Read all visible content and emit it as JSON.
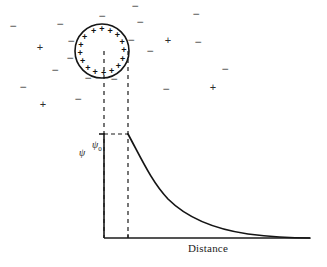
{
  "figure": {
    "kind": "electric-double-layer-diagram",
    "background_color": "#ffffff",
    "stroke_color": "#1b1b1b",
    "ion_color": "#3a3a3a"
  },
  "axes": {
    "y_axis_label": "ψ",
    "y_tick_label": "ψ",
    "y_tick_subscript": "0",
    "x_axis_label": "Distance",
    "origin": {
      "x": 104,
      "y": 238
    },
    "x_axis_end": {
      "x": 310,
      "y": 238
    },
    "y_axis_top": {
      "x": 104,
      "y": 133
    }
  },
  "particle": {
    "center": {
      "x": 102,
      "y": 51
    },
    "radius": 27,
    "surface_charge_symbol": "+",
    "surface_charge_count": 16,
    "surface_charge_angles_deg": [
      -112,
      -90,
      -68,
      -46,
      -24,
      -2,
      20,
      42,
      64,
      86,
      108,
      130,
      152,
      174,
      196,
      218
    ]
  },
  "guides": {
    "center_dashed_line_x": 104,
    "edge_dashed_line_x": 128,
    "dashed_top_y": 51,
    "dashed_bottom_y": 238,
    "potential_dashed_y": 134
  },
  "chart_data": {
    "type": "line",
    "title": "",
    "xlabel": "Distance",
    "ylabel": "ψ",
    "grid": false,
    "legend": "none",
    "annotations": [
      {
        "text": "ψ₀",
        "role": "surface-potential-tick",
        "x": 0.0,
        "y": 1.0
      }
    ],
    "xlim": [
      0,
      1
    ],
    "ylim": [
      0,
      1.05
    ],
    "series": [
      {
        "name": "potential-decay",
        "model": "exponential",
        "x": [
          0.0,
          0.05,
          0.1,
          0.15,
          0.2,
          0.25,
          0.3,
          0.35,
          0.4,
          0.45,
          0.5,
          0.55,
          0.6,
          0.65,
          0.7,
          0.75,
          0.8,
          0.85,
          0.9,
          0.95,
          1.0
        ],
        "values": [
          1.0,
          0.85,
          0.72,
          0.61,
          0.52,
          0.44,
          0.37,
          0.31,
          0.26,
          0.22,
          0.19,
          0.16,
          0.13,
          0.11,
          0.09,
          0.075,
          0.06,
          0.048,
          0.038,
          0.03,
          0.022
        ]
      }
    ]
  },
  "ion_cloud": {
    "negative_symbol": "−",
    "positive_symbol": "+",
    "ions": [
      {
        "sign": "−",
        "x": 13,
        "y": 26
      },
      {
        "sign": "−",
        "x": 60,
        "y": 24
      },
      {
        "sign": "+",
        "x": 40,
        "y": 47
      },
      {
        "sign": "−",
        "x": 55,
        "y": 70
      },
      {
        "sign": "−",
        "x": 23,
        "y": 87
      },
      {
        "sign": "+",
        "x": 43,
        "y": 104
      },
      {
        "sign": "−",
        "x": 78,
        "y": 99
      },
      {
        "sign": "−",
        "x": 102,
        "y": 16
      },
      {
        "sign": "−",
        "x": 135,
        "y": 6
      },
      {
        "sign": "−",
        "x": 140,
        "y": 22
      },
      {
        "sign": "−",
        "x": 71,
        "y": 41
      },
      {
        "sign": "−",
        "x": 70,
        "y": 58
      },
      {
        "sign": "−",
        "x": 131,
        "y": 40
      },
      {
        "sign": "−",
        "x": 88,
        "y": 78
      },
      {
        "sign": "−",
        "x": 114,
        "y": 79
      },
      {
        "sign": "+",
        "x": 168,
        "y": 40
      },
      {
        "sign": "−",
        "x": 150,
        "y": 51
      },
      {
        "sign": "−",
        "x": 196,
        "y": 14
      },
      {
        "sign": "−",
        "x": 198,
        "y": 42
      },
      {
        "sign": "−",
        "x": 225,
        "y": 69
      },
      {
        "sign": "+",
        "x": 213,
        "y": 87
      },
      {
        "sign": "−",
        "x": 166,
        "y": 89
      }
    ]
  }
}
